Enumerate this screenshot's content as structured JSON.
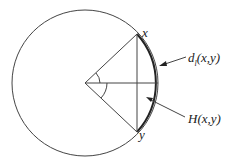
{
  "diagram": {
    "type": "circle-chord-geometry",
    "labels": {
      "point_x": "x",
      "point_y": "y",
      "arc_label_main": "d",
      "arc_label_sub": "l",
      "arc_label_args": "(x,y)",
      "chord_label": "H(x,y)"
    },
    "colors": {
      "stroke": "#333333",
      "background": "#ffffff"
    }
  }
}
